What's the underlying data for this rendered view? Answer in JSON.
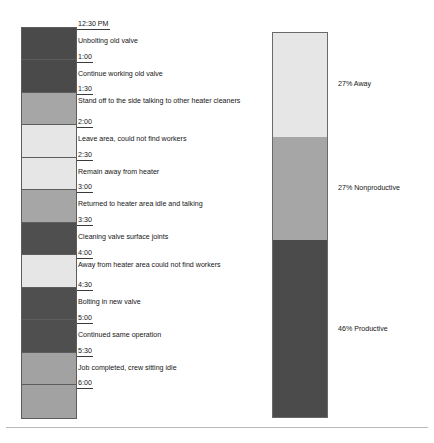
{
  "figure": {
    "legend_colors": {
      "productive": "#4a4a4a",
      "nonproductive": "#9a9a9a",
      "away": "#e2e2e2"
    }
  },
  "timeline": {
    "start_time": "12:30 PM",
    "end_time": "6:00",
    "interval_minutes": 30,
    "rows": [
      {
        "time": "12:30 PM",
        "activity": "Unbolting old valve",
        "category": "productive",
        "color": "#4a4a4a",
        "lines": 1
      },
      {
        "time": "1:00",
        "activity": "Continue working old valve",
        "category": "productive",
        "color": "#4a4a4a",
        "lines": 1
      },
      {
        "time": "1:30",
        "activity": "Stand off to the side talking to other heater cleaners",
        "category": "nonproductive",
        "color": "#a6a6a6",
        "lines": 2
      },
      {
        "time": "2:00",
        "activity": "Leave area, could not find workers",
        "category": "away",
        "color": "#e6e6e6",
        "lines": 1
      },
      {
        "time": "2:30",
        "activity": "Remain away from heater",
        "category": "away",
        "color": "#e6e6e6",
        "lines": 1
      },
      {
        "time": "3:00",
        "activity": "Returned to heater area idle and talking",
        "category": "nonproductive",
        "color": "#a6a6a6",
        "lines": 1
      },
      {
        "time": "3:30",
        "activity": "Cleaning valve surface joints",
        "category": "productive",
        "color": "#4f4f4f",
        "lines": 1
      },
      {
        "time": "4:00",
        "activity": "Away from heater area could not find workers",
        "category": "away",
        "color": "#e6e6e6",
        "lines": 2
      },
      {
        "time": "4:30",
        "activity": "Bolting in new valve",
        "category": "productive",
        "color": "#4f4f4f",
        "lines": 1
      },
      {
        "time": "5:00",
        "activity": "Continued same operation",
        "category": "productive",
        "color": "#4f4f4f",
        "lines": 1
      },
      {
        "time": "5:30",
        "activity": "Job completed, crew sitting idle",
        "category": "nonproductive",
        "color": "#a2a2a2",
        "lines": 1
      },
      {
        "time": "6:00",
        "activity": "",
        "category": "nonproductive",
        "color": "#a2a2a2",
        "lines": 0
      }
    ]
  },
  "chart_data": {
    "type": "bar",
    "title": "",
    "xlabel": "",
    "ylabel": "",
    "categories": [
      "Away",
      "Nonproductive",
      "Productive"
    ],
    "values": [
      27,
      27,
      46
    ],
    "unit": "%",
    "stacked": true,
    "orientation": "vertical",
    "grid": false,
    "legend": "inline-right",
    "ylim": [
      0,
      100
    ],
    "segments": [
      {
        "label": "27% Away",
        "percent": 27,
        "color": "#e6e6e6",
        "name": "Away"
      },
      {
        "label": "27% Nonproductive",
        "percent": 27,
        "color": "#a6a6a6",
        "name": "Nonproductive"
      },
      {
        "label": "46% Productive",
        "percent": 46,
        "color": "#4b4b4b",
        "name": "Productive"
      }
    ]
  }
}
